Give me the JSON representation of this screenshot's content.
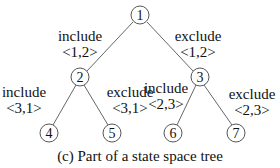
{
  "diagram": {
    "type": "tree",
    "nodes": [
      {
        "id": "1",
        "label": "1",
        "x": 140,
        "y": 15
      },
      {
        "id": "2",
        "label": "2",
        "x": 80,
        "y": 77
      },
      {
        "id": "3",
        "label": "3",
        "x": 200,
        "y": 77
      },
      {
        "id": "4",
        "label": "4",
        "x": 49,
        "y": 133
      },
      {
        "id": "5",
        "label": "5",
        "x": 112,
        "y": 133
      },
      {
        "id": "6",
        "label": "6",
        "x": 173,
        "y": 133
      },
      {
        "id": "7",
        "label": "7",
        "x": 236,
        "y": 133
      }
    ],
    "edges": [
      {
        "from": "1",
        "to": "2",
        "action": "include",
        "pair": "<1,2>"
      },
      {
        "from": "1",
        "to": "3",
        "action": "exclude",
        "pair": "<1,2>"
      },
      {
        "from": "2",
        "to": "4",
        "action": "include",
        "pair": "<3,1>"
      },
      {
        "from": "2",
        "to": "5",
        "action": "exclude",
        "pair": "<3,1>"
      },
      {
        "from": "3",
        "to": "6",
        "action": "include",
        "pair": "<2,3>"
      },
      {
        "from": "3",
        "to": "7",
        "action": "exclude",
        "pair": "<2,3>"
      }
    ],
    "caption": "(c) Part of a state space tree"
  }
}
